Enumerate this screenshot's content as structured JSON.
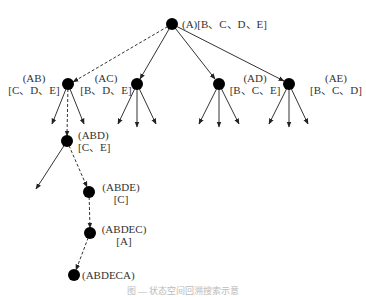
{
  "diagram": {
    "type": "search-tree",
    "nodes": [
      {
        "id": "A",
        "x": 172,
        "y": 24,
        "line1": "(A)[B、C、D、E]",
        "line2": ""
      },
      {
        "id": "AB",
        "x": 68,
        "y": 84,
        "line1": "(AB)",
        "line2": "[C、D、E]"
      },
      {
        "id": "AC",
        "x": 137,
        "y": 84,
        "line1": "(AC)",
        "line2": "[B、D、E]"
      },
      {
        "id": "AD",
        "x": 219,
        "y": 84,
        "line1": "(AD)",
        "line2": "[B、C、E]"
      },
      {
        "id": "AE",
        "x": 289,
        "y": 84,
        "line1": "(AE)",
        "line2": "[B、C、D]"
      },
      {
        "id": "ABD",
        "x": 67,
        "y": 141,
        "line1": "(ABD)",
        "line2": "[C、E]"
      },
      {
        "id": "ABDE",
        "x": 89,
        "y": 192,
        "line1": "(ABDE)",
        "line2": "[C]"
      },
      {
        "id": "ABDEC",
        "x": 90,
        "y": 233,
        "line1": "(ABDEC)",
        "line2": "[A]"
      },
      {
        "id": "ABDECA",
        "x": 74,
        "y": 275,
        "line1": "(ABDECA)",
        "line2": ""
      }
    ],
    "edges": [
      {
        "from": "A",
        "to": "AB",
        "style": "dashed"
      },
      {
        "from": "A",
        "to": "AC",
        "style": "solid"
      },
      {
        "from": "A",
        "to": "AD",
        "style": "solid"
      },
      {
        "from": "A",
        "to": "AE",
        "style": "solid"
      },
      {
        "from": "AB",
        "to": "ABD",
        "style": "dashed"
      },
      {
        "from": "ABD",
        "to": "ABDE",
        "style": "dashed"
      },
      {
        "from": "ABDE",
        "to": "ABDEC",
        "style": "dashed"
      },
      {
        "from": "ABDEC",
        "to": "ABDECA",
        "style": "dashed"
      }
    ],
    "caption": "图 — 状态空间回溯搜索示意"
  }
}
